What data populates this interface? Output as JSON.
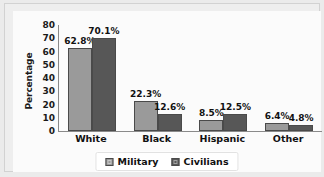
{
  "chart_data": {
    "type": "bar",
    "title": "",
    "subtitle": "",
    "xlabel": "",
    "ylabel": "Percentage",
    "categories": [
      "White",
      "Black",
      "Hispanic",
      "Other"
    ],
    "series": [
      {
        "name": "Military",
        "color": "#9a9a9a",
        "values": [
          62.8,
          22.3,
          8.5,
          6.4
        ],
        "labels": [
          "62.8%",
          "22.3%",
          "8.5%",
          "6.4%"
        ]
      },
      {
        "name": "Civilians",
        "color": "#575757",
        "values": [
          70.1,
          12.6,
          12.5,
          4.8
        ],
        "labels": [
          "70.1%",
          "12.6%",
          "12.5%",
          "4.8%"
        ]
      }
    ],
    "ylim": [
      0,
      80
    ],
    "yticks": [
      80,
      70,
      60,
      50,
      40,
      30,
      20,
      10,
      0
    ],
    "ytick_labels": [
      "80",
      "70",
      "60",
      "50",
      "40",
      "30",
      "20",
      "10",
      "0"
    ],
    "grid": false,
    "legend_position": "bottom-center",
    "legend_entries": [
      "Military",
      "Civilians"
    ],
    "plot_background": "#fbfbfb",
    "frame_background": "#eeeeee"
  },
  "legend": {
    "military_label": "Military",
    "civilians_label": "Civilians"
  },
  "axis": {
    "ylabel": "Percentage"
  }
}
